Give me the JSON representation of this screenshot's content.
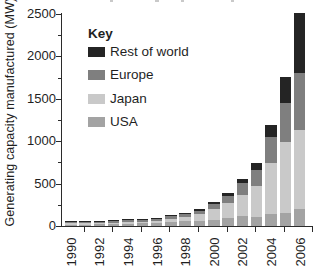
{
  "figure": {
    "y_axis_title": "Generating capacity manufactured (MW)",
    "legend": {
      "title": "Key",
      "items": [
        {
          "label": "Rest of world",
          "color": "#242424"
        },
        {
          "label": "Europe",
          "color": "#7f7f7f"
        },
        {
          "label": "Japan",
          "color": "#c9c9c9"
        },
        {
          "label": "USA",
          "color": "#a3a3a3"
        }
      ]
    }
  },
  "chart_data": {
    "type": "bar",
    "stacked": true,
    "title": "",
    "xlabel": "",
    "ylabel": "Generating capacity manufactured (MW)",
    "ylim": [
      0,
      2500
    ],
    "y_major_ticks": [
      0,
      500,
      1000,
      1500,
      2000,
      2500
    ],
    "y_minor_tick_interval": 250,
    "grid": false,
    "legend_position": "upper-left-inside",
    "categories": [
      1990,
      1991,
      1992,
      1993,
      1994,
      1995,
      1996,
      1997,
      1998,
      1999,
      2000,
      2001,
      2002,
      2003,
      2004,
      2005,
      2006
    ],
    "x_tick_labels": [
      "1990",
      "1992",
      "1994",
      "1996",
      "1998",
      "2000",
      "2002",
      "2004",
      "2006"
    ],
    "series": [
      {
        "name": "USA",
        "color": "#a3a3a3",
        "values": [
          15,
          17,
          18,
          22,
          26,
          35,
          39,
          51,
          54,
          61,
          75,
          100,
          120,
          105,
          140,
          155,
          200
        ]
      },
      {
        "name": "Japan",
        "color": "#c9c9c9",
        "values": [
          17,
          20,
          19,
          17,
          17,
          16,
          21,
          35,
          49,
          80,
          130,
          170,
          250,
          365,
          600,
          830,
          930
        ]
      },
      {
        "name": "Europe",
        "color": "#7f7f7f",
        "values": [
          10,
          13,
          16,
          17,
          22,
          20,
          19,
          30,
          34,
          40,
          60,
          86,
          135,
          190,
          315,
          470,
          680
        ]
      },
      {
        "name": "Rest of world",
        "color": "#242424",
        "values": [
          5,
          5,
          5,
          4,
          6,
          6,
          10,
          9,
          19,
          21,
          23,
          34,
          55,
          85,
          140,
          300,
          700
        ]
      }
    ]
  }
}
